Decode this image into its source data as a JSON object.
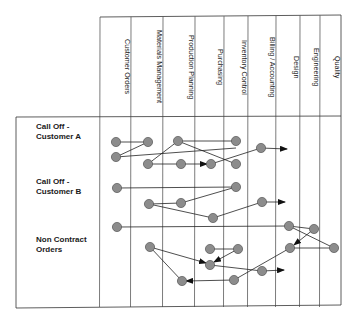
{
  "diagram": {
    "columns": [
      {
        "label": "Customer Orders",
        "x0": 100,
        "x1": 131
      },
      {
        "label": "Materials Management",
        "x0": 131,
        "x1": 163
      },
      {
        "label": "Production Planning",
        "x0": 163,
        "x1": 195
      },
      {
        "label": "Purchasing",
        "x0": 195,
        "x1": 224
      },
      {
        "label": "Inventory Control",
        "x0": 224,
        "x1": 248
      },
      {
        "label": "Billing / Accounting",
        "x0": 248,
        "x1": 276
      },
      {
        "label": "Design",
        "x0": 276,
        "x1": 300
      },
      {
        "label": "Engineering",
        "x0": 300,
        "x1": 320
      },
      {
        "label": "Quality",
        "x0": 320,
        "x1": 341
      }
    ],
    "rows": [
      {
        "label": "Call Off -\nCustomer A",
        "y": 122
      },
      {
        "label": "Call Off -\nCustomer B",
        "y": 177
      },
      {
        "label": "Non Contract\nOrders",
        "y": 235
      }
    ],
    "dots": [
      [
        116,
        142
      ],
      [
        148,
        142
      ],
      [
        116,
        157
      ],
      [
        148,
        164
      ],
      [
        178,
        141
      ],
      [
        181,
        164
      ],
      [
        211,
        164
      ],
      [
        236,
        141
      ],
      [
        236,
        164
      ],
      [
        261,
        148
      ],
      [
        117,
        188
      ],
      [
        236,
        187
      ],
      [
        149,
        204
      ],
      [
        181,
        203
      ],
      [
        213,
        218
      ],
      [
        262,
        202
      ],
      [
        117,
        227
      ],
      [
        289,
        226
      ],
      [
        314,
        229
      ],
      [
        150,
        247
      ],
      [
        210,
        249
      ],
      [
        238,
        249
      ],
      [
        290,
        248
      ],
      [
        334,
        248
      ],
      [
        210,
        265
      ],
      [
        262,
        271
      ],
      [
        182,
        281
      ],
      [
        234,
        280
      ]
    ],
    "lines": [
      [
        116,
        142,
        148,
        142,
        0
      ],
      [
        148,
        142,
        116,
        157,
        0
      ],
      [
        116,
        157,
        236,
        148,
        0
      ],
      [
        148,
        164,
        178,
        141,
        0
      ],
      [
        178,
        141,
        236,
        164,
        0
      ],
      [
        178,
        141,
        236,
        141,
        0
      ],
      [
        148,
        164,
        181,
        164,
        0
      ],
      [
        181,
        164,
        207,
        164,
        1
      ],
      [
        211,
        164,
        261,
        148,
        0
      ],
      [
        261,
        148,
        287,
        149,
        1
      ],
      [
        117,
        188,
        236,
        187,
        0
      ],
      [
        149,
        204,
        181,
        203,
        0
      ],
      [
        181,
        203,
        236,
        187,
        0
      ],
      [
        149,
        204,
        213,
        218,
        0
      ],
      [
        213,
        218,
        262,
        202,
        0
      ],
      [
        262,
        202,
        285,
        202,
        1
      ],
      [
        117,
        227,
        289,
        226,
        0
      ],
      [
        289,
        226,
        314,
        229,
        0
      ],
      [
        289,
        226,
        334,
        248,
        0
      ],
      [
        314,
        229,
        294,
        245,
        1
      ],
      [
        334,
        248,
        290,
        248,
        0
      ],
      [
        290,
        248,
        234,
        280,
        0
      ],
      [
        210,
        249,
        238,
        249,
        0
      ],
      [
        238,
        249,
        214,
        262,
        1
      ],
      [
        150,
        247,
        206,
        263,
        1
      ],
      [
        210,
        265,
        262,
        271,
        0
      ],
      [
        262,
        271,
        284,
        270,
        1
      ],
      [
        150,
        247,
        182,
        281,
        0
      ],
      [
        234,
        280,
        186,
        281,
        1
      ]
    ]
  }
}
